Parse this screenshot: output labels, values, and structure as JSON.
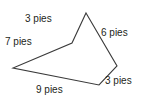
{
  "figure": {
    "type": "polygon-with-side-labels",
    "shape_name": "pentagon",
    "stroke_color": "#3a3a3a",
    "text_color": "#231f20",
    "background_color": "#ffffff",
    "vertices": [
      {
        "name": "apex",
        "x": 86,
        "y": 13
      },
      {
        "name": "right-vertex",
        "x": 117,
        "y": 66
      },
      {
        "name": "bottom-vertex",
        "x": 99,
        "y": 85
      },
      {
        "name": "left-vertex",
        "x": 13,
        "y": 68
      },
      {
        "name": "concave-vertex",
        "x": 72,
        "y": 43
      }
    ],
    "points_attr": "86,13 117,66 99,85 13,68 72,43",
    "sides": [
      {
        "id": "top",
        "label": "3 pies",
        "value": 3,
        "unit": "pies"
      },
      {
        "id": "left",
        "label": "7 pies",
        "value": 7,
        "unit": "pies"
      },
      {
        "id": "upper-right",
        "label": "6 pies",
        "value": 6,
        "unit": "pies"
      },
      {
        "id": "lower-right",
        "label": "3 pies",
        "value": 3,
        "unit": "pies"
      },
      {
        "id": "bottom",
        "label": "9 pies",
        "value": 9,
        "unit": "pies"
      }
    ]
  }
}
